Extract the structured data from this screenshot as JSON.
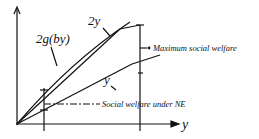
{
  "diagram": {
    "axes": {
      "x_label": "y",
      "y_label": ""
    },
    "curves": [
      {
        "label": "2y",
        "kind": "line"
      },
      {
        "label": "2g(by)",
        "kind": "concave-curve"
      },
      {
        "label": "y",
        "kind": "line"
      }
    ],
    "annotations": {
      "max_welfare": "Maximum social welfare",
      "ne_welfare": "Social welfare under NE"
    },
    "colors": {
      "ink": "#111111",
      "background": "#ffffff"
    }
  }
}
